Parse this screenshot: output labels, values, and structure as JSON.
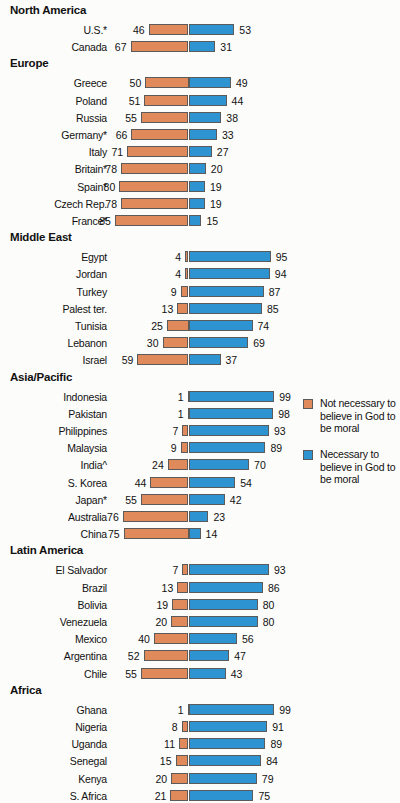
{
  "legend": {
    "items": [
      {
        "color": "#e08a5c",
        "swatch_name": "legend-swatch-orange",
        "label": "Not necessary to believe in God to be moral"
      },
      {
        "color": "#2e93d1",
        "swatch_name": "legend-swatch-blue",
        "label": "Necessary to believe in God to be moral"
      }
    ]
  },
  "chart_data": {
    "type": "bar",
    "title": "",
    "subtitle": "",
    "xlabel": "",
    "ylabel": "",
    "orientation": "horizontal",
    "style": "diverging-bar",
    "grid": false,
    "legend_position": "right",
    "axis_center_value": 0,
    "xlim": [
      0,
      100
    ],
    "series": [
      {
        "name": "Not necessary to believe in God to be moral",
        "color": "#e08a5c",
        "side": "left"
      },
      {
        "name": "Necessary to believe in God to be moral",
        "color": "#2e93d1",
        "side": "right"
      }
    ],
    "groups": [
      {
        "name": "North America",
        "rows": [
          {
            "label": "U.S.*",
            "left": 46,
            "right": 53
          },
          {
            "label": "Canada",
            "left": 67,
            "right": 31
          }
        ]
      },
      {
        "name": "Europe",
        "rows": [
          {
            "label": "Greece",
            "left": 50,
            "right": 49
          },
          {
            "label": "Poland",
            "left": 51,
            "right": 44
          },
          {
            "label": "Russia",
            "left": 55,
            "right": 38
          },
          {
            "label": "Germany*",
            "left": 66,
            "right": 33
          },
          {
            "label": "Italy",
            "left": 71,
            "right": 27
          },
          {
            "label": "Britain*",
            "left": 78,
            "right": 20
          },
          {
            "label": "Spain*",
            "left": 80,
            "right": 19
          },
          {
            "label": "Czech Rep.",
            "left": 78,
            "right": 19
          },
          {
            "label": "France*",
            "left": 85,
            "right": 15
          }
        ]
      },
      {
        "name": "Middle East",
        "rows": [
          {
            "label": "Egypt",
            "left": 4,
            "right": 95
          },
          {
            "label": "Jordan",
            "left": 4,
            "right": 94
          },
          {
            "label": "Turkey",
            "left": 9,
            "right": 87
          },
          {
            "label": "Palest ter.",
            "left": 13,
            "right": 85
          },
          {
            "label": "Tunisia",
            "left": 25,
            "right": 74
          },
          {
            "label": "Lebanon",
            "left": 30,
            "right": 69
          },
          {
            "label": "Israel",
            "left": 59,
            "right": 37
          }
        ]
      },
      {
        "name": "Asia/Pacific",
        "rows": [
          {
            "label": "Indonesia",
            "left": 1,
            "right": 99
          },
          {
            "label": "Pakistan",
            "left": 1,
            "right": 98
          },
          {
            "label": "Philippines",
            "left": 7,
            "right": 93
          },
          {
            "label": "Malaysia",
            "left": 9,
            "right": 89
          },
          {
            "label": "India^",
            "left": 24,
            "right": 70
          },
          {
            "label": "S. Korea",
            "left": 44,
            "right": 54
          },
          {
            "label": "Japan*",
            "left": 55,
            "right": 42
          },
          {
            "label": "Australia",
            "left": 76,
            "right": 23
          },
          {
            "label": "China",
            "left": 75,
            "right": 14
          }
        ]
      },
      {
        "name": "Latin America",
        "rows": [
          {
            "label": "El Salvador",
            "left": 7,
            "right": 93
          },
          {
            "label": "Brazil",
            "left": 13,
            "right": 86
          },
          {
            "label": "Bolivia",
            "left": 19,
            "right": 80
          },
          {
            "label": "Venezuela",
            "left": 20,
            "right": 80
          },
          {
            "label": "Mexico",
            "left": 40,
            "right": 56
          },
          {
            "label": "Argentina",
            "left": 52,
            "right": 47
          },
          {
            "label": "Chile",
            "left": 55,
            "right": 43
          }
        ]
      },
      {
        "name": "Africa",
        "rows": [
          {
            "label": "Ghana",
            "left": 1,
            "right": 99
          },
          {
            "label": "Nigeria",
            "left": 8,
            "right": 91
          },
          {
            "label": "Uganda",
            "left": 11,
            "right": 89
          },
          {
            "label": "Senegal",
            "left": 15,
            "right": 84
          },
          {
            "label": "Kenya",
            "left": 20,
            "right": 79
          },
          {
            "label": "S. Africa",
            "left": 21,
            "right": 75
          }
        ]
      }
    ]
  }
}
